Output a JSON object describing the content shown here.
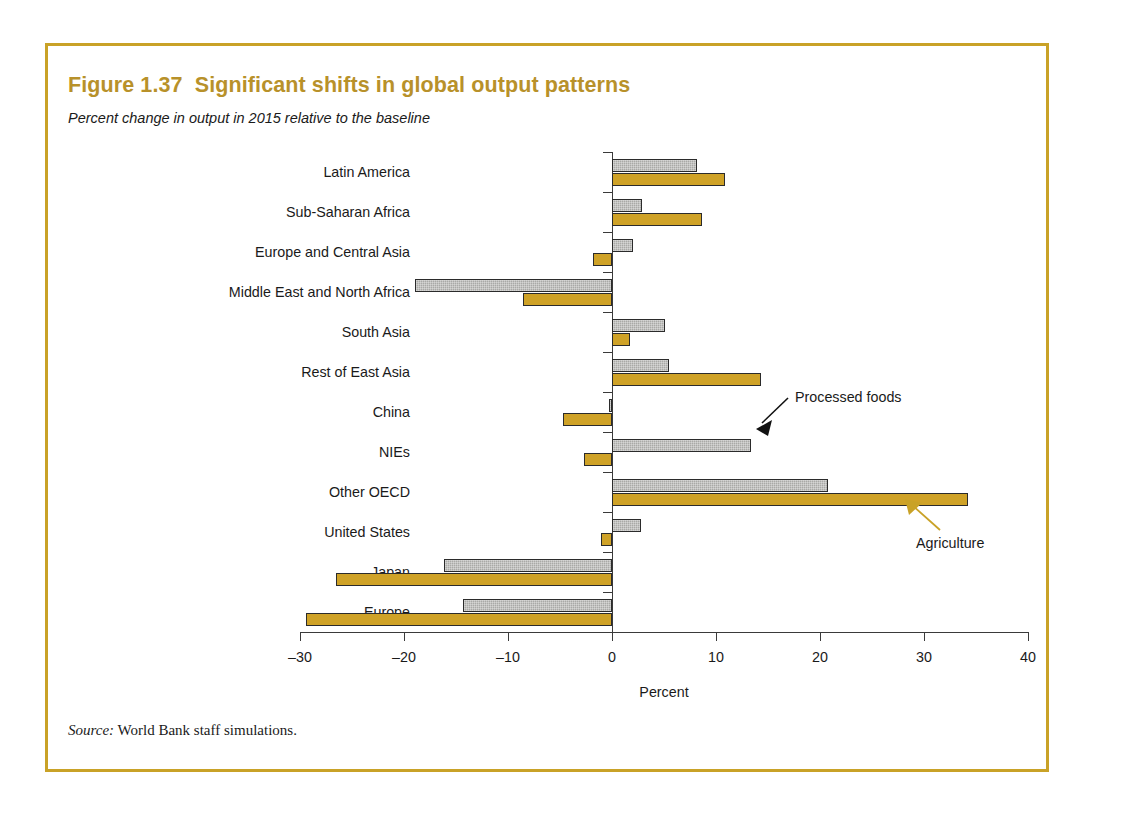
{
  "figure": {
    "title": "Figure 1.37  Significant shifts in global output patterns",
    "subtitle": "Percent change in output in 2015 relative to the baseline",
    "source_label": "Source:",
    "source_text": " World Bank staff simulations.",
    "border_color": "#c9a227",
    "title_color": "#b8912a"
  },
  "annotations": {
    "processed_foods": "Processed foods",
    "agriculture": "Agriculture"
  },
  "chart_data": {
    "type": "bar",
    "orientation": "horizontal",
    "title": "Figure 1.37  Significant shifts in global output patterns",
    "subtitle": "Percent change in output in 2015 relative to the baseline",
    "xlabel": "Percent",
    "ylabel": "",
    "xlim": [
      -30,
      40
    ],
    "xticks": [
      -30,
      -20,
      -10,
      0,
      10,
      20,
      30,
      40
    ],
    "xtick_labels": [
      "–30",
      "–20",
      "–10",
      "0",
      "10",
      "20",
      "30",
      "40"
    ],
    "grid": false,
    "legend": "annotated",
    "categories": [
      "Latin America",
      "Sub-Saharan Africa",
      "Europe and Central Asia",
      "Middle East and North Africa",
      "South Asia",
      "Rest of East Asia",
      "China",
      "NIEs",
      "Other OECD",
      "United States",
      "Japan",
      "Europe"
    ],
    "series": [
      {
        "name": "Processed foods",
        "color": "#a9a9a6",
        "values": [
          8.2,
          2.9,
          2.0,
          -18.9,
          5.1,
          5.5,
          -0.3,
          13.4,
          20.8,
          2.8,
          -16.2,
          -14.3
        ]
      },
      {
        "name": "Agriculture",
        "color": "#cfa227",
        "values": [
          10.9,
          8.7,
          -1.8,
          -8.6,
          1.7,
          14.3,
          -4.7,
          -2.7,
          34.2,
          -1.1,
          -26.5,
          -29.4
        ]
      }
    ]
  }
}
